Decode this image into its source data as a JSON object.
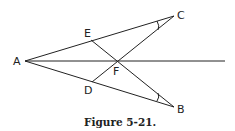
{
  "figure": {
    "caption": "Figure 5-21.",
    "points": {
      "A": {
        "label": "A",
        "x": 25,
        "y": 61
      },
      "B": {
        "label": "B",
        "x": 174,
        "y": 107
      },
      "C": {
        "label": "C",
        "x": 174,
        "y": 16
      },
      "D": {
        "label": "D",
        "x": 92,
        "y": 82
      },
      "E": {
        "label": "E",
        "x": 91,
        "y": 40
      },
      "F": {
        "label": "F",
        "x": 116,
        "y": 61
      }
    },
    "segments": [
      [
        "A",
        "C"
      ],
      [
        "A",
        "B"
      ],
      [
        "E",
        "B"
      ],
      [
        "D",
        "C"
      ]
    ],
    "ray": {
      "from": "A",
      "to_x": 225,
      "to_y": 61
    },
    "angle_marks": [
      "C",
      "B"
    ]
  }
}
